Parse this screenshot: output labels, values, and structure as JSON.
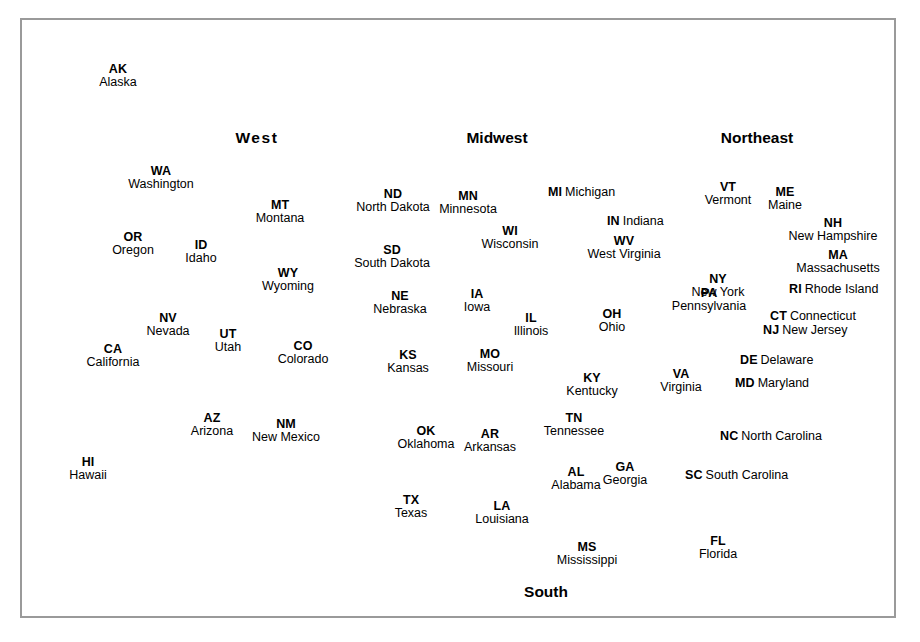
{
  "colors": {
    "state_fill": "#c9c9c9",
    "state_stroke": "#1a1a1a",
    "frame": "#9a9a9a",
    "background": "#ffffff",
    "text": "#000000"
  },
  "regions": [
    {
      "label": "West",
      "x": 257,
      "y": 129,
      "spaced": true
    },
    {
      "label": "Midwest",
      "x": 497,
      "y": 129,
      "spaced": false
    },
    {
      "label": "Northeast",
      "x": 757,
      "y": 129,
      "spaced": false
    },
    {
      "label": "South",
      "x": 546,
      "y": 583,
      "spaced": false
    }
  ],
  "states": [
    {
      "abbr": "AK",
      "name": "Alaska",
      "x": 118,
      "y": 63,
      "style": "stacked"
    },
    {
      "abbr": "WA",
      "name": "Washington",
      "x": 161,
      "y": 165,
      "style": "stacked"
    },
    {
      "abbr": "OR",
      "name": "Oregon",
      "x": 133,
      "y": 231,
      "style": "stacked"
    },
    {
      "abbr": "ID",
      "name": "Idaho",
      "x": 201,
      "y": 239,
      "style": "stacked"
    },
    {
      "abbr": "MT",
      "name": "Montana",
      "x": 280,
      "y": 199,
      "style": "stacked"
    },
    {
      "abbr": "WY",
      "name": "Wyoming",
      "x": 288,
      "y": 267,
      "style": "stacked"
    },
    {
      "abbr": "NV",
      "name": "Nevada",
      "x": 168,
      "y": 312,
      "style": "stacked"
    },
    {
      "abbr": "UT",
      "name": "Utah",
      "x": 228,
      "y": 328,
      "style": "stacked"
    },
    {
      "abbr": "CO",
      "name": "Colorado",
      "x": 303,
      "y": 340,
      "style": "stacked"
    },
    {
      "abbr": "CA",
      "name": "California",
      "x": 113,
      "y": 343,
      "style": "stacked"
    },
    {
      "abbr": "AZ",
      "name": "Arizona",
      "x": 212,
      "y": 412,
      "style": "stacked"
    },
    {
      "abbr": "NM",
      "name": "New Mexico",
      "x": 286,
      "y": 418,
      "style": "stacked"
    },
    {
      "abbr": "HI",
      "name": "Hawaii",
      "x": 88,
      "y": 456,
      "style": "stacked"
    },
    {
      "abbr": "ND",
      "name": "North Dakota",
      "x": 393,
      "y": 188,
      "style": "stacked"
    },
    {
      "abbr": "SD",
      "name": "South Dakota",
      "x": 392,
      "y": 244,
      "style": "stacked"
    },
    {
      "abbr": "NE",
      "name": "Nebraska",
      "x": 400,
      "y": 290,
      "style": "stacked"
    },
    {
      "abbr": "KS",
      "name": "Kansas",
      "x": 408,
      "y": 349,
      "style": "stacked"
    },
    {
      "abbr": "MN",
      "name": "Minnesota",
      "x": 468,
      "y": 190,
      "style": "stacked"
    },
    {
      "abbr": "IA",
      "name": "Iowa",
      "x": 477,
      "y": 288,
      "style": "stacked"
    },
    {
      "abbr": "MO",
      "name": "Missouri",
      "x": 490,
      "y": 348,
      "style": "stacked"
    },
    {
      "abbr": "WI",
      "name": "Wisconsin",
      "x": 510,
      "y": 225,
      "style": "stacked"
    },
    {
      "abbr": "IL",
      "name": "Illinois",
      "x": 531,
      "y": 312,
      "style": "stacked"
    },
    {
      "abbr": "MI",
      "name": "Michigan",
      "x": 548,
      "y": 183,
      "style": "inline"
    },
    {
      "abbr": "IN",
      "name": "Indiana",
      "x": 607,
      "y": 212,
      "style": "inline"
    },
    {
      "abbr": "OH",
      "name": "Ohio",
      "x": 612,
      "y": 308,
      "style": "stacked"
    },
    {
      "abbr": "WV",
      "name": "West Virginia",
      "x": 624,
      "y": 235,
      "style": "stacked"
    },
    {
      "abbr": "KY",
      "name": "Kentucky",
      "x": 592,
      "y": 372,
      "style": "stacked"
    },
    {
      "abbr": "OK",
      "name": "Oklahoma",
      "x": 426,
      "y": 425,
      "style": "stacked"
    },
    {
      "abbr": "AR",
      "name": "Arkansas",
      "x": 490,
      "y": 428,
      "style": "stacked"
    },
    {
      "abbr": "TN",
      "name": "Tennessee",
      "x": 574,
      "y": 412,
      "style": "stacked"
    },
    {
      "abbr": "TX",
      "name": "Texas",
      "x": 411,
      "y": 494,
      "style": "stacked"
    },
    {
      "abbr": "LA",
      "name": "Louisiana",
      "x": 502,
      "y": 500,
      "style": "stacked"
    },
    {
      "abbr": "MS",
      "name": "Mississippi",
      "x": 587,
      "y": 541,
      "style": "stacked"
    },
    {
      "abbr": "AL",
      "name": "Alabama",
      "x": 576,
      "y": 466,
      "style": "stacked"
    },
    {
      "abbr": "GA",
      "name": "Georgia",
      "x": 625,
      "y": 461,
      "style": "stacked"
    },
    {
      "abbr": "FL",
      "name": "Florida",
      "x": 718,
      "y": 535,
      "style": "stacked"
    },
    {
      "abbr": "SC",
      "name": "South Carolina",
      "x": 685,
      "y": 466,
      "style": "inline"
    },
    {
      "abbr": "NC",
      "name": "North Carolina",
      "x": 720,
      "y": 427,
      "style": "inline"
    },
    {
      "abbr": "VA",
      "name": "Virginia",
      "x": 681,
      "y": 368,
      "style": "stacked"
    },
    {
      "abbr": "MD",
      "name": "Maryland",
      "x": 735,
      "y": 374,
      "style": "inline"
    },
    {
      "abbr": "DE",
      "name": "Delaware",
      "x": 740,
      "y": 351,
      "style": "inline"
    },
    {
      "abbr": "PA",
      "name": "Pennsylvania",
      "x": 709,
      "y": 287,
      "style": "stacked"
    },
    {
      "abbr": "NJ",
      "name": "New Jersey",
      "x": 763,
      "y": 321,
      "style": "inline"
    },
    {
      "abbr": "NY",
      "name": "New York",
      "x": 718,
      "y": 273,
      "style": "stacked"
    },
    {
      "abbr": "CT",
      "name": "Connecticut",
      "x": 770,
      "y": 307,
      "style": "inline"
    },
    {
      "abbr": "RI",
      "name": "Rhode Island",
      "x": 789,
      "y": 280,
      "style": "inline"
    },
    {
      "abbr": "MA",
      "name": "Massachusetts",
      "x": 838,
      "y": 249,
      "style": "stacked"
    },
    {
      "abbr": "NH",
      "name": "New Hampshire",
      "x": 833,
      "y": 217,
      "style": "stacked"
    },
    {
      "abbr": "VT",
      "name": "Vermont",
      "x": 728,
      "y": 181,
      "style": "stacked"
    },
    {
      "abbr": "ME",
      "name": "Maine",
      "x": 785,
      "y": 186,
      "style": "stacked"
    }
  ],
  "leader_lines": [
    {
      "name": "michigan-leader",
      "x1": 566,
      "y1": 190,
      "x2": 578,
      "y2": 290
    },
    {
      "name": "michigan-leader-2",
      "x1": 566,
      "y1": 190,
      "x2": 585,
      "y2": 208
    },
    {
      "name": "indiana-leader",
      "x1": 597,
      "y1": 219,
      "x2": 562,
      "y2": 298
    },
    {
      "name": "west-virginia-leader",
      "x1": 624,
      "y1": 250,
      "x2": 644,
      "y2": 353
    },
    {
      "name": "vermont-leader",
      "x1": 733,
      "y1": 196,
      "x2": 745,
      "y2": 232
    },
    {
      "name": "maine-leader",
      "x1": 786,
      "y1": 200,
      "x2": 790,
      "y2": 216
    },
    {
      "name": "new-hampshire-leader",
      "x1": 784,
      "y1": 232,
      "x2": 762,
      "y2": 238
    },
    {
      "name": "massachusetts-leader",
      "x1": 786,
      "y1": 250,
      "x2": 766,
      "y2": 256
    },
    {
      "name": "rhode-island-leader",
      "x1": 783,
      "y1": 280,
      "x2": 762,
      "y2": 262
    },
    {
      "name": "connecticut-leader",
      "x1": 765,
      "y1": 307,
      "x2": 753,
      "y2": 279
    },
    {
      "name": "new-jersey-leader",
      "x1": 760,
      "y1": 321,
      "x2": 739,
      "y2": 300
    },
    {
      "name": "delaware-leader",
      "x1": 737,
      "y1": 351,
      "x2": 716,
      "y2": 339
    },
    {
      "name": "maryland-leader",
      "x1": 731,
      "y1": 374,
      "x2": 711,
      "y2": 349
    },
    {
      "name": "north-carolina-leader",
      "x1": 716,
      "y1": 427,
      "x2": 696,
      "y2": 403
    },
    {
      "name": "south-carolina-leader",
      "x1": 681,
      "y1": 466,
      "x2": 661,
      "y2": 440
    },
    {
      "name": "florida-leader",
      "x1": 707,
      "y1": 531,
      "x2": 664,
      "y2": 530
    },
    {
      "name": "mississippi-leader",
      "x1": 571,
      "y1": 534,
      "x2": 541,
      "y2": 459
    }
  ]
}
